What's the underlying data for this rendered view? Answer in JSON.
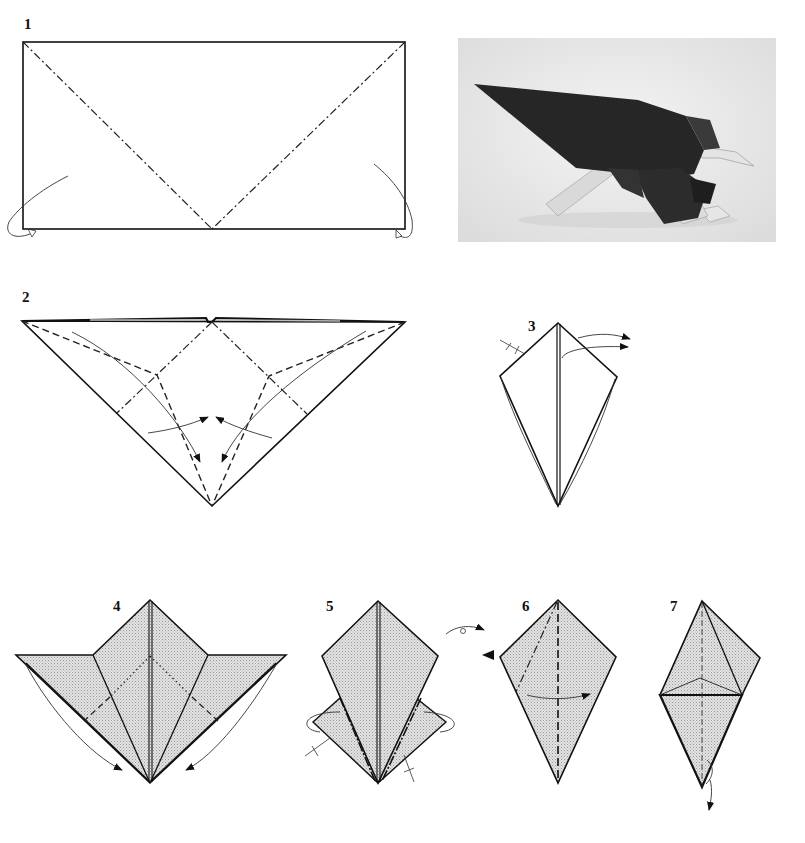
{
  "steps": [
    {
      "number": "1",
      "description": "Rectangle with two mountain-fold diagonals meeting at bottom center; corners turned behind"
    },
    {
      "number": "2",
      "description": "Triangle with valley and mountain folds; flaps swung inward"
    },
    {
      "number": "3",
      "description": "Kite shape; fold flap over to the right"
    },
    {
      "number": "4",
      "description": "Shaded base with side flaps folded down along edges"
    },
    {
      "number": "5",
      "description": "Kite with side flaps; tuck flaps behind; turn over"
    },
    {
      "number": "6",
      "description": "Kite; fold flap to the right along dashed line"
    },
    {
      "number": "7",
      "description": "Kite with horizontal crease; pull bottom point down"
    }
  ],
  "photo": {
    "subject": "Finished origami eagle",
    "colors": {
      "body": "#2a2a2a",
      "accent": "#d8d8d8",
      "background": "#ececec"
    }
  },
  "colors": {
    "line": "#111111",
    "shade": "#d4d4d4",
    "paper": "#ffffff"
  },
  "labels": {
    "s1": "1",
    "s2": "2",
    "s3": "3",
    "s4": "4",
    "s5": "5",
    "s6": "6",
    "s7": "7"
  }
}
